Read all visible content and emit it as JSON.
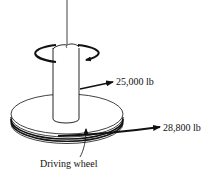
{
  "diagram": {
    "forces": [
      {
        "id": "shaft-force",
        "label": "25,000 lb"
      },
      {
        "id": "belt-force",
        "label": "28,800 lb"
      }
    ],
    "labels": {
      "driving_wheel": "Driving wheel"
    },
    "colors": {
      "line": "#111111",
      "background": "#ffffff"
    }
  }
}
